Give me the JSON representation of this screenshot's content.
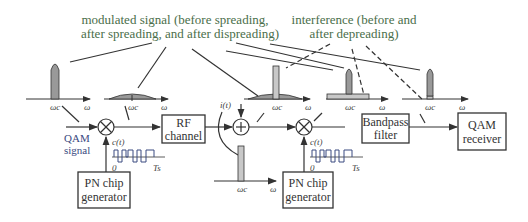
{
  "annotations": {
    "modulated_line1": "modulated signal (before spreading,",
    "modulated_line2": "after spreading, and after dispreading)",
    "interference_line1": "interference (before and",
    "interference_line2": "after depreading)"
  },
  "blocks": {
    "rf_channel_line1": "RF",
    "rf_channel_line2": "channel",
    "pn1_line1": "PN chip",
    "pn1_line2": "generator",
    "pn2_line1": "PN chip",
    "pn2_line2": "generator",
    "bandpass_line1": "Bandpass",
    "bandpass_line2": "filter",
    "qam_rx_line1": "QAM",
    "qam_rx_line2": "receiver"
  },
  "labels": {
    "qam_signal_line1": "QAM",
    "qam_signal_line2": "signal",
    "chip1": "c(t)",
    "chip2": "c(t)",
    "zero1": "0",
    "ts1": "Ts",
    "zero2": "0",
    "ts2": "Ts",
    "interference": "i(t)",
    "omega": "ω",
    "omega_c": "ωc"
  },
  "operators": {
    "multiplier": "⊗",
    "adder": "⊕"
  },
  "colors": {
    "line": "#333333",
    "spectrum_fill": "#999999",
    "interference_fill": "#c8c8c8",
    "annotation_text": "#4a6e4a"
  }
}
